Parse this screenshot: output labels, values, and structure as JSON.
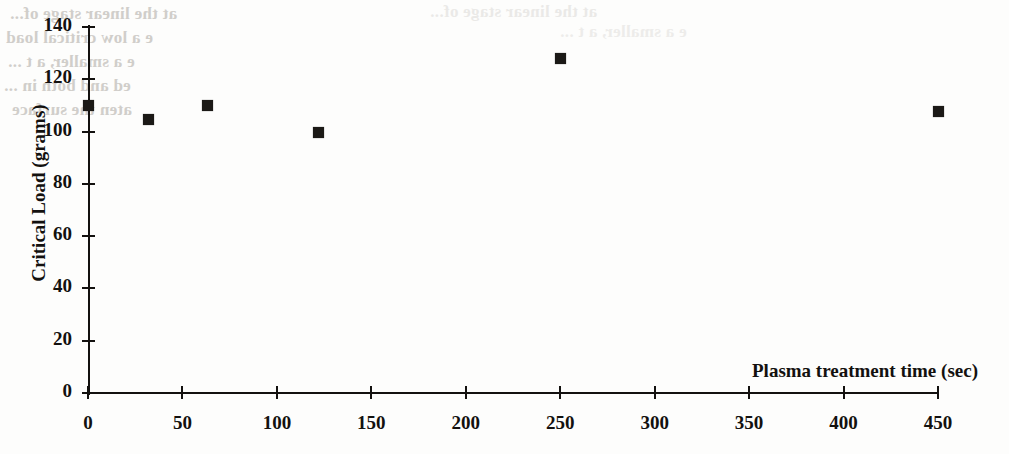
{
  "figure": {
    "background_color": "#fdfdfc",
    "ink_color": "#13110f",
    "marker_color": "#1b1916"
  },
  "bleed_through": {
    "note": "faint mirrored show-through text from the reverse side of the scanned page",
    "color": "#c9c6c2",
    "lines": [
      "at the linear stage of...",
      "e a low critical load",
      "e a smaller, a t ...",
      "ed and both in ...",
      "aten the surface"
    ]
  },
  "chart_data": {
    "type": "scatter",
    "title": "",
    "xlabel": "Plasma treatment time (sec)",
    "ylabel": "Critical Load (grams)",
    "xlim": [
      0,
      450
    ],
    "ylim": [
      0,
      140
    ],
    "xticks": [
      0,
      50,
      100,
      150,
      200,
      250,
      300,
      350,
      400,
      450
    ],
    "xticklabels": [
      "0",
      "50",
      "100",
      "150",
      "200",
      "250",
      "300",
      "350",
      "400",
      "450"
    ],
    "yticks": [
      0,
      20,
      40,
      60,
      80,
      100,
      120,
      140
    ],
    "yticklabels": [
      "0",
      "20",
      "40",
      "60",
      "80",
      "100",
      "120",
      "140"
    ],
    "grid": false,
    "legend": false,
    "marker": "filled-square",
    "series": [
      {
        "name": "Critical load vs plasma treatment time",
        "points": [
          {
            "x": 0,
            "y": 110
          },
          {
            "x": 32,
            "y": 105
          },
          {
            "x": 63,
            "y": 110
          },
          {
            "x": 122,
            "y": 100
          },
          {
            "x": 250,
            "y": 128
          },
          {
            "x": 450,
            "y": 108
          }
        ]
      }
    ]
  }
}
